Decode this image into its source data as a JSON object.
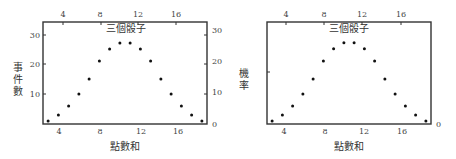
{
  "chart_data": [
    {
      "type": "scatter",
      "title": "三個骰子",
      "xlabel": "點數和",
      "ylabel": "事件數",
      "x": [
        3,
        4,
        5,
        6,
        7,
        8,
        9,
        10,
        11,
        12,
        13,
        14,
        15,
        16,
        17,
        18
      ],
      "values": [
        1,
        3,
        6,
        10,
        15,
        21,
        25,
        27,
        27,
        25,
        21,
        15,
        10,
        6,
        3,
        1
      ],
      "xlim": [
        2.5,
        18.5
      ],
      "ylim": [
        0,
        34
      ],
      "x_ticks_bottom": [
        4,
        8,
        12,
        16
      ],
      "x_ticks_top": [
        4,
        8,
        12,
        16
      ],
      "y_ticks_left": [
        10,
        20,
        30
      ],
      "y_ticks_right": [
        0,
        10,
        20,
        30
      ],
      "grid": false
    },
    {
      "type": "scatter",
      "title": "三個骰子",
      "xlabel": "點數和",
      "ylabel": "機率",
      "x": [
        3,
        4,
        5,
        6,
        7,
        8,
        9,
        10,
        11,
        12,
        13,
        14,
        15,
        16,
        17,
        18
      ],
      "values": [
        0.0046,
        0.0139,
        0.0278,
        0.0463,
        0.0694,
        0.0972,
        0.1157,
        0.125,
        0.125,
        0.1157,
        0.0972,
        0.0694,
        0.0463,
        0.0278,
        0.0139,
        0.0046
      ],
      "xlim": [
        2.5,
        18.5
      ],
      "ylim": [
        0,
        0.157
      ],
      "x_ticks_bottom": [
        4,
        8,
        12,
        16
      ],
      "x_ticks_top": [
        4,
        8,
        12,
        16
      ],
      "y_ticks_left": [],
      "y_ticks_right": [
        0
      ],
      "grid": false
    }
  ],
  "labels": {
    "left_title": "三個骰子",
    "left_xlabel": "點數和",
    "left_ylabel_chars": [
      "事",
      "件",
      "數"
    ],
    "right_title": "三個骰子",
    "right_xlabel": "點數和",
    "right_ylabel_chars": [
      "機",
      "率"
    ],
    "tick_4": "4",
    "tick_8": "8",
    "tick_12": "12",
    "tick_16": "16",
    "tick_0": "0",
    "tick_10": "10",
    "tick_20": "20",
    "tick_30": "30"
  }
}
